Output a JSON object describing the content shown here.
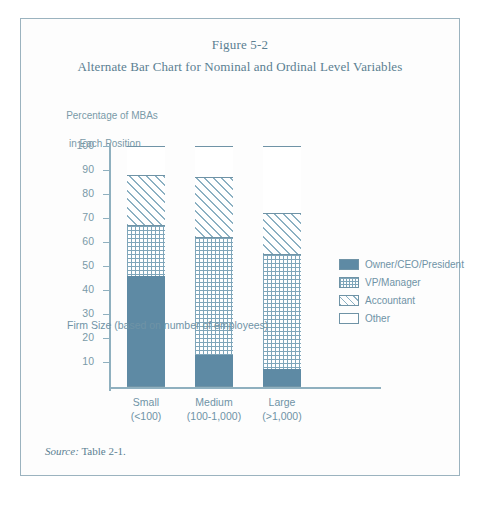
{
  "figure": {
    "number": "Figure 5-2",
    "caption": "Alternate Bar Chart for Nominal and Ordinal Level Variables",
    "source_prefix": "Source:",
    "source_text": "Table 2-1."
  },
  "axis_label_line1": "Percentage of MBAs",
  "axis_label_line2": "in Each Position",
  "chart_data": {
    "type": "bar",
    "title": "Alternate Bar Chart for Nominal and Ordinal Level Variables",
    "subtitle": "Figure 5-2",
    "stacked": true,
    "categories": [
      "Small",
      "Medium",
      "Large"
    ],
    "category_sublabels": [
      "(<100)",
      "(100-1,000)",
      "(>1,000)"
    ],
    "series": [
      {
        "name": "Owner/CEO/President",
        "pattern": "solid",
        "color": "#5e8aa4",
        "values": [
          46,
          13,
          7
        ]
      },
      {
        "name": "VP/Manager",
        "pattern": "grid",
        "color": "#7fa6ba",
        "values": [
          21,
          49,
          48
        ]
      },
      {
        "name": "Accountant",
        "pattern": "hatch",
        "color": "#8bb0c2",
        "values": [
          21,
          25,
          17
        ]
      },
      {
        "name": "Other",
        "pattern": "empty",
        "color": "#ffffff",
        "values": [
          12,
          13,
          28
        ]
      }
    ],
    "cumulative_tops": [
      [
        46,
        67,
        88,
        100
      ],
      [
        13,
        62,
        87,
        100
      ],
      [
        7,
        55,
        72,
        100
      ]
    ],
    "xlabel": "Firm Size  (based on number of employees)",
    "ylabel": "Percentage of MBAs in Each Position",
    "ylim": [
      0,
      100
    ],
    "yticks": [
      10,
      20,
      30,
      40,
      50,
      60,
      70,
      80,
      90,
      100
    ],
    "grid": false,
    "legend_position": "right"
  },
  "legend": [
    {
      "label": "Owner/CEO/President",
      "pattern": "solid"
    },
    {
      "label": "VP/Manager",
      "pattern": "grid"
    },
    {
      "label": "Accountant",
      "pattern": "hatch"
    },
    {
      "label": "Other",
      "pattern": "empty"
    }
  ]
}
